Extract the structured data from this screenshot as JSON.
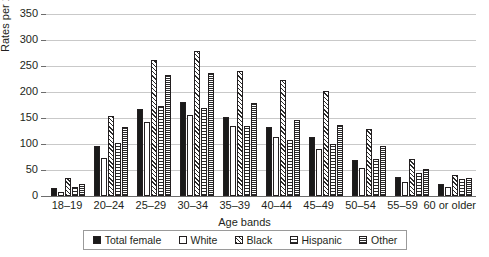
{
  "chart_data": {
    "type": "bar",
    "title": "",
    "xlabel": "Age bands",
    "ylabel": "Rates per 100,000",
    "ylim": [
      0,
      350
    ],
    "ytick_step": 50,
    "yticks": [
      "350",
      "300",
      "250",
      "200",
      "150",
      "100",
      "50",
      "0"
    ],
    "grid": true,
    "legend_position": "bottom",
    "categories": [
      "18–19",
      "20–24",
      "25–29",
      "30–34",
      "35–39",
      "40–44",
      "45–49",
      "50–54",
      "55–59",
      "60 or older"
    ],
    "series": [
      {
        "name": "Total female",
        "pattern": "solid-black",
        "values": [
          15,
          96,
          168,
          180,
          152,
          132,
          113,
          70,
          36,
          24
        ]
      },
      {
        "name": "White",
        "pattern": "fine-dots",
        "values": [
          8,
          73,
          142,
          156,
          134,
          113,
          90,
          53,
          26,
          17
        ]
      },
      {
        "name": "Black",
        "pattern": "diagonal-hatch",
        "values": [
          34,
          154,
          261,
          278,
          240,
          223,
          202,
          128,
          71,
          41
        ]
      },
      {
        "name": "Hispanic",
        "pattern": "grid-crosshatch",
        "values": [
          17,
          101,
          174,
          169,
          134,
          107,
          100,
          71,
          44,
          33
        ]
      },
      {
        "name": "Other",
        "pattern": "dense-checker",
        "values": [
          24,
          132,
          233,
          236,
          178,
          146,
          137,
          96,
          52,
          34
        ]
      }
    ]
  },
  "colors": {
    "series_ink": "#1a1a1a",
    "gridline": "#c9c9c9",
    "axis": "#6d6d6d",
    "text": "#231f20",
    "background": "#ffffff"
  }
}
